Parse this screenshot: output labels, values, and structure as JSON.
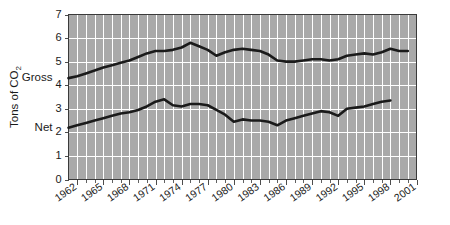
{
  "chart_data": {
    "type": "line",
    "title": "",
    "xlabel": "",
    "ylabel": "Tons of CO",
    "ylabel_sub": "2",
    "ylim": [
      0,
      7
    ],
    "xlim": [
      1961,
      2001
    ],
    "grid": true,
    "legend_position": "inline-left",
    "yticks": [
      0,
      1,
      2,
      3,
      4,
      5,
      6,
      7
    ],
    "ytick_labels": [
      "0",
      "1",
      "2",
      "3",
      "4",
      "5",
      "6",
      "7"
    ],
    "xticks": [
      1962,
      1965,
      1968,
      1971,
      1974,
      1977,
      1980,
      1983,
      1986,
      1989,
      1992,
      1995,
      1998,
      2001
    ],
    "xtick_labels": [
      "1962",
      "1965",
      "1968",
      "1971",
      "1974",
      "1977",
      "1980",
      "1983",
      "1986",
      "1989",
      "1992",
      "1995",
      "1998",
      "2001"
    ],
    "x": [
      1961,
      1962,
      1963,
      1964,
      1965,
      1966,
      1967,
      1968,
      1969,
      1970,
      1971,
      1972,
      1973,
      1974,
      1975,
      1976,
      1977,
      1978,
      1979,
      1980,
      1981,
      1982,
      1983,
      1984,
      1985,
      1986,
      1987,
      1988,
      1989,
      1990,
      1991,
      1992,
      1993,
      1994,
      1995,
      1996,
      1997,
      1998,
      1999,
      2000
    ],
    "series": [
      {
        "name": "Gross",
        "label": "Gross",
        "color": "#1a1a1a",
        "values": [
          4.3,
          4.38,
          4.5,
          4.62,
          4.75,
          4.85,
          4.95,
          5.05,
          5.2,
          5.35,
          5.45,
          5.45,
          5.5,
          5.6,
          5.8,
          5.65,
          5.5,
          5.25,
          5.4,
          5.5,
          5.55,
          5.5,
          5.45,
          5.3,
          5.05,
          5.0,
          5.0,
          5.05,
          5.1,
          5.1,
          5.05,
          5.1,
          5.25,
          5.3,
          5.35,
          5.3,
          5.4,
          5.55,
          5.45,
          5.45
        ],
        "end_year": 2000
      },
      {
        "name": "Net",
        "label": "Net",
        "color": "#1a1a1a",
        "values": [
          2.2,
          2.3,
          2.4,
          2.5,
          2.6,
          2.7,
          2.8,
          2.85,
          2.95,
          3.1,
          3.3,
          3.4,
          3.15,
          3.1,
          3.2,
          3.2,
          3.15,
          2.95,
          2.75,
          2.45,
          2.55,
          2.5,
          2.5,
          2.45,
          2.3,
          2.5,
          2.6,
          2.7,
          2.8,
          2.9,
          2.85,
          2.7,
          3.0,
          3.05,
          3.1,
          3.2,
          3.3,
          3.35,
          null,
          null
        ],
        "end_year": 1998
      }
    ]
  },
  "axis": {
    "y_title": "Tons of CO",
    "y_title_subscript": "2"
  }
}
